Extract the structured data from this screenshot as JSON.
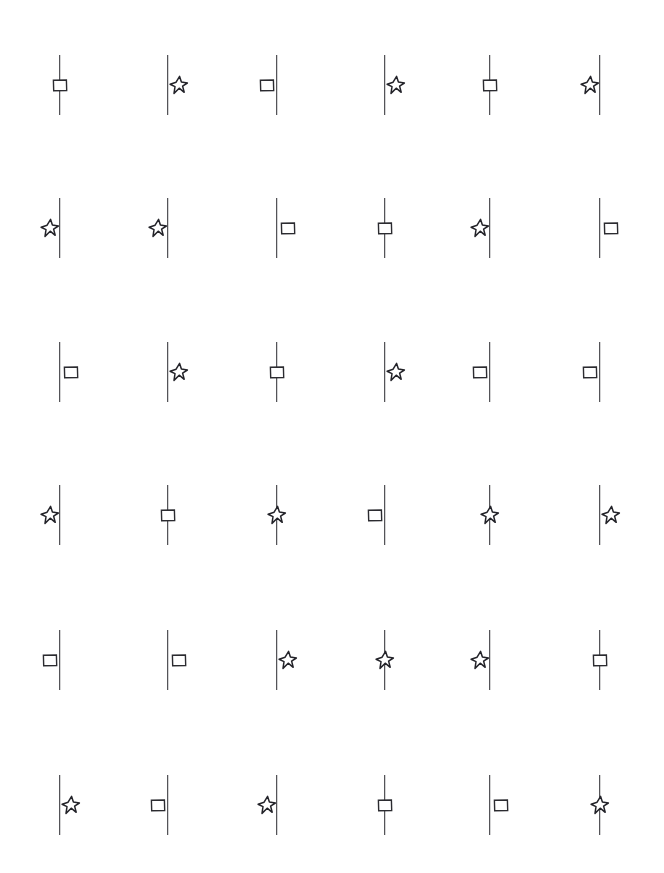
{
  "page": {
    "background_color": "#ffffff",
    "ink_color": "#2b2b30",
    "columns": 6,
    "rows": 6,
    "column_x": [
      60,
      168,
      277,
      385,
      490,
      600
    ],
    "row_y": [
      85,
      228,
      372,
      515,
      660,
      805
    ],
    "line_length": 60,
    "glyph_size": 20,
    "shape_names": {
      "square": "square-icon",
      "star": "star-icon"
    },
    "position_names": {
      "left": "left-of-line",
      "center": "centered-on-line",
      "right": "right-of-line"
    }
  },
  "cells": [
    [
      {
        "shape": "square",
        "position": "center"
      },
      {
        "shape": "star",
        "position": "right"
      },
      {
        "shape": "square",
        "position": "left"
      },
      {
        "shape": "star",
        "position": "right"
      },
      {
        "shape": "square",
        "position": "center"
      },
      {
        "shape": "star",
        "position": "left"
      }
    ],
    [
      {
        "shape": "star",
        "position": "left"
      },
      {
        "shape": "star",
        "position": "left"
      },
      {
        "shape": "square",
        "position": "right"
      },
      {
        "shape": "square",
        "position": "center"
      },
      {
        "shape": "star",
        "position": "left"
      },
      {
        "shape": "square",
        "position": "right"
      }
    ],
    [
      {
        "shape": "square",
        "position": "right"
      },
      {
        "shape": "star",
        "position": "right"
      },
      {
        "shape": "square",
        "position": "center"
      },
      {
        "shape": "star",
        "position": "right"
      },
      {
        "shape": "square",
        "position": "left"
      },
      {
        "shape": "square",
        "position": "left"
      }
    ],
    [
      {
        "shape": "star",
        "position": "left"
      },
      {
        "shape": "square",
        "position": "center"
      },
      {
        "shape": "star",
        "position": "center"
      },
      {
        "shape": "square",
        "position": "left"
      },
      {
        "shape": "star",
        "position": "center"
      },
      {
        "shape": "star",
        "position": "right"
      }
    ],
    [
      {
        "shape": "square",
        "position": "left"
      },
      {
        "shape": "square",
        "position": "right"
      },
      {
        "shape": "star",
        "position": "right"
      },
      {
        "shape": "star",
        "position": "center"
      },
      {
        "shape": "star",
        "position": "left"
      },
      {
        "shape": "square",
        "position": "center"
      }
    ],
    [
      {
        "shape": "star",
        "position": "right"
      },
      {
        "shape": "square",
        "position": "left"
      },
      {
        "shape": "star",
        "position": "left"
      },
      {
        "shape": "square",
        "position": "center"
      },
      {
        "shape": "square",
        "position": "right"
      },
      {
        "shape": "star",
        "position": "center"
      }
    ]
  ]
}
